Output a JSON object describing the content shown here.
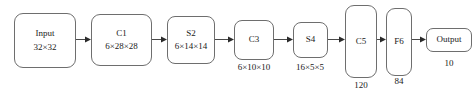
{
  "diagram": {
    "background_color": "#ffffff",
    "stroke_color": "#6e6e6e",
    "text_color": "#1a1a1a",
    "nodes": [
      {
        "id": "input",
        "label": "Input",
        "shape_label": "32×32",
        "sublabel": ""
      },
      {
        "id": "c1",
        "label": "C1",
        "shape_label": "6×28×28",
        "sublabel": ""
      },
      {
        "id": "s2",
        "label": "S2",
        "shape_label": "6×14×14",
        "sublabel": ""
      },
      {
        "id": "c3",
        "label": "C3",
        "shape_label": "",
        "sublabel": "6×10×10"
      },
      {
        "id": "s4",
        "label": "S4",
        "shape_label": "",
        "sublabel": "16×5×5"
      },
      {
        "id": "c5",
        "label": "C5",
        "shape_label": "",
        "sublabel": "120"
      },
      {
        "id": "f6",
        "label": "F6",
        "shape_label": "",
        "sublabel": "84"
      },
      {
        "id": "output",
        "label": "Output",
        "shape_label": "",
        "sublabel": "10"
      }
    ],
    "connections": [
      {
        "from": "input",
        "to": "c1"
      },
      {
        "from": "c1",
        "to": "s2"
      },
      {
        "from": "s2",
        "to": "c3"
      },
      {
        "from": "c3",
        "to": "s4"
      },
      {
        "from": "s4",
        "to": "c5"
      },
      {
        "from": "c5",
        "to": "f6"
      },
      {
        "from": "f6",
        "to": "output"
      }
    ]
  }
}
